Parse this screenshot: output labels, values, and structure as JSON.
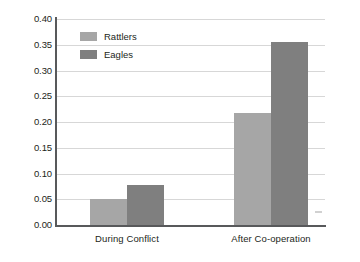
{
  "chart_data": {
    "type": "bar",
    "title": "",
    "subtitle": "",
    "xlabel": "",
    "ylabel": "Per cent",
    "categories": [
      "During Conflict",
      "After Co-operation"
    ],
    "series": [
      {
        "name": "Rattlers",
        "color": "#a6a6a6",
        "values": [
          0.05,
          0.218
        ]
      },
      {
        "name": "Eagles",
        "color": "#7f7f7f",
        "values": [
          0.078,
          0.355
        ]
      }
    ],
    "ylim": [
      0.0,
      0.4
    ],
    "ytick_values": [
      0.0,
      0.05,
      0.1,
      0.15,
      0.2,
      0.25,
      0.3,
      0.35,
      0.4
    ],
    "ytick_labels": [
      "0.00",
      "0.05",
      "0.10",
      "0.15",
      "0.20",
      "0.25",
      "0.30",
      "0.35",
      "0.40"
    ],
    "grid": true,
    "grid_axis": "y",
    "legend_position": "upper-left-inside",
    "background_color": "#ffffff",
    "axis_color": "#58595b",
    "gridline_color": "#d7d7d7",
    "text_color": "#231f20"
  }
}
